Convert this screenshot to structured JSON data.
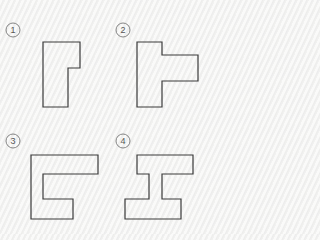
{
  "diagram": {
    "background": "#f3f3f2",
    "stroke_color": "#3a3a3a",
    "items": [
      {
        "label": "1",
        "badge": {
          "cx": 13,
          "cy": 30,
          "r": 7
        },
        "shape_points": "43,42 80,42 80,68 68,68 68,107 43,107"
      },
      {
        "label": "2",
        "badge": {
          "cx": 123,
          "cy": 30,
          "r": 7
        },
        "shape_points": "137,42 162,42 162,55 198,55 198,81 162,81 162,107 137,107"
      },
      {
        "label": "3",
        "badge": {
          "cx": 13,
          "cy": 141,
          "r": 7
        },
        "shape_points": "31,155 98,155 98,174 43,174 43,199 73,199 73,219 31,219"
      },
      {
        "label": "4",
        "badge": {
          "cx": 123,
          "cy": 141,
          "r": 7
        },
        "shape_points": "137,155 193,155 193,174 162,174 162,199 181,199 181,219 125,219 125,199 149,199 149,174 137,174"
      }
    ]
  }
}
